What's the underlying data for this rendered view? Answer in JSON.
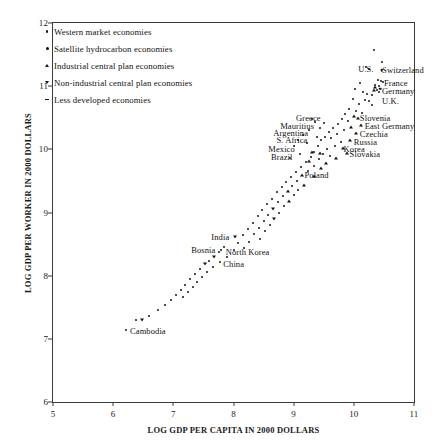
{
  "chart_data": {
    "type": "scatter",
    "title": "",
    "xlabel": "LOG GDP PER CAPITA IN 2000 DOLLARS",
    "ylabel": "LOG GDP PER WORKER IN 2000 DOLLARS",
    "xlim": [
      5,
      11
    ],
    "ylim": [
      6,
      12
    ],
    "xticks": [
      5,
      6,
      7,
      8,
      9,
      10,
      11
    ],
    "yticks": [
      6,
      7,
      8,
      9,
      10,
      11,
      12
    ],
    "grid": false,
    "legend_position": "top-left",
    "legend": [
      {
        "label": "Western market economies",
        "marker": "dot"
      },
      {
        "label": "Satellite hydrocarbon economies",
        "marker": "dot-lg"
      },
      {
        "label": "Industrial central plan economies",
        "marker": "tri"
      },
      {
        "label": "Non-industrial central plan economies",
        "marker": "tri-d"
      },
      {
        "label": "Less developed economies",
        "marker": "dash"
      }
    ],
    "annotations": [
      {
        "text": "U.S.",
        "x": 10.33,
        "y": 11.27,
        "align": "right"
      },
      {
        "text": "Switzerland",
        "x": 10.47,
        "y": 11.25,
        "align": "left"
      },
      {
        "text": "France",
        "x": 10.5,
        "y": 11.05,
        "align": "left"
      },
      {
        "text": "Germany",
        "x": 10.47,
        "y": 10.92,
        "align": "left"
      },
      {
        "text": "U.K.",
        "x": 10.47,
        "y": 10.76,
        "align": "left"
      },
      {
        "text": "Slovenia",
        "x": 10.1,
        "y": 10.5,
        "align": "left"
      },
      {
        "text": "East Germany",
        "x": 10.18,
        "y": 10.37,
        "align": "left"
      },
      {
        "text": "Czechia",
        "x": 10.1,
        "y": 10.24,
        "align": "left"
      },
      {
        "text": "Russia",
        "x": 10.0,
        "y": 10.12,
        "align": "left"
      },
      {
        "text": "Korea",
        "x": 9.83,
        "y": 10.0,
        "align": "left"
      },
      {
        "text": "Slovakia",
        "x": 9.93,
        "y": 9.92,
        "align": "left"
      },
      {
        "text": "Greece",
        "x": 9.45,
        "y": 10.5,
        "align": "right"
      },
      {
        "text": "Mauritius",
        "x": 9.34,
        "y": 10.37,
        "align": "right"
      },
      {
        "text": "Argentina",
        "x": 9.24,
        "y": 10.26,
        "align": "right"
      },
      {
        "text": "S. Africa",
        "x": 9.23,
        "y": 10.15,
        "align": "right"
      },
      {
        "text": "Mexico",
        "x": 9.02,
        "y": 10.0,
        "align": "right"
      },
      {
        "text": "Brazil",
        "x": 8.98,
        "y": 9.88,
        "align": "right"
      },
      {
        "text": "Poland",
        "x": 9.18,
        "y": 9.6,
        "align": "left"
      },
      {
        "text": "India",
        "x": 7.93,
        "y": 8.62,
        "align": "right"
      },
      {
        "text": "Bosnia",
        "x": 7.7,
        "y": 8.4,
        "align": "right"
      },
      {
        "text": "North Korea",
        "x": 7.87,
        "y": 8.37,
        "align": "left"
      },
      {
        "text": "China",
        "x": 7.83,
        "y": 8.18,
        "align": "left"
      },
      {
        "text": "Cambodia",
        "x": 6.28,
        "y": 7.12,
        "align": "left"
      }
    ],
    "points": [
      {
        "x": 10.33,
        "y": 11.58,
        "m": "dot"
      },
      {
        "x": 10.2,
        "y": 11.3,
        "m": "dot"
      },
      {
        "x": 10.46,
        "y": 11.38,
        "m": "dot"
      },
      {
        "x": 10.25,
        "y": 11.27,
        "m": "dot"
      },
      {
        "x": 10.46,
        "y": 11.25,
        "m": "dot-lg"
      },
      {
        "x": 10.4,
        "y": 11.1,
        "m": "dot"
      },
      {
        "x": 10.45,
        "y": 11.08,
        "m": "dot"
      },
      {
        "x": 10.48,
        "y": 11.06,
        "m": "dot"
      },
      {
        "x": 10.36,
        "y": 11.02,
        "m": "dot"
      },
      {
        "x": 10.42,
        "y": 11.0,
        "m": "dot"
      },
      {
        "x": 10.44,
        "y": 10.96,
        "m": "dot-lg"
      },
      {
        "x": 10.38,
        "y": 10.94,
        "m": "dot"
      },
      {
        "x": 10.41,
        "y": 10.9,
        "m": "dot"
      },
      {
        "x": 10.1,
        "y": 11.05,
        "m": "dot"
      },
      {
        "x": 10.02,
        "y": 10.95,
        "m": "dot"
      },
      {
        "x": 10.16,
        "y": 10.9,
        "m": "dot"
      },
      {
        "x": 10.22,
        "y": 10.88,
        "m": "dot"
      },
      {
        "x": 10.3,
        "y": 10.86,
        "m": "dot"
      },
      {
        "x": 10.18,
        "y": 10.78,
        "m": "dot"
      },
      {
        "x": 10.26,
        "y": 10.76,
        "m": "dot"
      },
      {
        "x": 10.08,
        "y": 10.72,
        "m": "dot"
      },
      {
        "x": 9.98,
        "y": 10.8,
        "m": "dot"
      },
      {
        "x": 10.3,
        "y": 10.7,
        "m": "dot"
      },
      {
        "x": 9.92,
        "y": 10.64,
        "m": "dot"
      },
      {
        "x": 10.04,
        "y": 10.6,
        "m": "dot"
      },
      {
        "x": 10.14,
        "y": 10.58,
        "m": "dot"
      },
      {
        "x": 9.86,
        "y": 10.56,
        "m": "dot"
      },
      {
        "x": 10.0,
        "y": 10.52,
        "m": "tri"
      },
      {
        "x": 10.07,
        "y": 10.5,
        "m": "tri"
      },
      {
        "x": 9.8,
        "y": 10.48,
        "m": "dot"
      },
      {
        "x": 9.9,
        "y": 10.45,
        "m": "dot"
      },
      {
        "x": 10.12,
        "y": 10.38,
        "m": "tri"
      },
      {
        "x": 9.74,
        "y": 10.4,
        "m": "dot"
      },
      {
        "x": 9.96,
        "y": 10.36,
        "m": "tri"
      },
      {
        "x": 9.66,
        "y": 10.34,
        "m": "dot"
      },
      {
        "x": 9.84,
        "y": 10.3,
        "m": "dot"
      },
      {
        "x": 10.03,
        "y": 10.26,
        "m": "tri"
      },
      {
        "x": 9.58,
        "y": 10.28,
        "m": "dot"
      },
      {
        "x": 9.72,
        "y": 10.24,
        "m": "dot"
      },
      {
        "x": 9.62,
        "y": 10.18,
        "m": "dot"
      },
      {
        "x": 9.94,
        "y": 10.14,
        "m": "tri"
      },
      {
        "x": 9.52,
        "y": 10.2,
        "m": "dot"
      },
      {
        "x": 9.78,
        "y": 10.12,
        "m": "dot"
      },
      {
        "x": 9.46,
        "y": 10.14,
        "m": "dot"
      },
      {
        "x": 9.68,
        "y": 10.06,
        "m": "dot"
      },
      {
        "x": 9.82,
        "y": 10.02,
        "m": "tri"
      },
      {
        "x": 9.56,
        "y": 10.0,
        "m": "dot"
      },
      {
        "x": 9.88,
        "y": 9.94,
        "m": "tri"
      },
      {
        "x": 9.4,
        "y": 10.06,
        "m": "dot"
      },
      {
        "x": 9.34,
        "y": 9.96,
        "m": "dot"
      },
      {
        "x": 9.48,
        "y": 9.92,
        "m": "dot"
      },
      {
        "x": 9.6,
        "y": 9.9,
        "m": "dot"
      },
      {
        "x": 9.28,
        "y": 9.88,
        "m": "dot"
      },
      {
        "x": 9.7,
        "y": 9.86,
        "m": "tri"
      },
      {
        "x": 9.42,
        "y": 9.84,
        "m": "dot"
      },
      {
        "x": 9.2,
        "y": 9.8,
        "m": "dot"
      },
      {
        "x": 9.54,
        "y": 9.78,
        "m": "tri"
      },
      {
        "x": 9.33,
        "y": 9.74,
        "m": "dot"
      },
      {
        "x": 9.12,
        "y": 9.72,
        "m": "dot"
      },
      {
        "x": 9.46,
        "y": 9.7,
        "m": "tri"
      },
      {
        "x": 9.24,
        "y": 9.66,
        "m": "dot"
      },
      {
        "x": 9.04,
        "y": 9.64,
        "m": "dot"
      },
      {
        "x": 9.14,
        "y": 9.6,
        "m": "tri"
      },
      {
        "x": 9.34,
        "y": 9.58,
        "m": "tri"
      },
      {
        "x": 8.96,
        "y": 9.56,
        "m": "dot"
      },
      {
        "x": 9.06,
        "y": 9.5,
        "m": "dot"
      },
      {
        "x": 8.88,
        "y": 9.48,
        "m": "dot"
      },
      {
        "x": 9.18,
        "y": 9.44,
        "m": "tri"
      },
      {
        "x": 8.98,
        "y": 9.42,
        "m": "dot"
      },
      {
        "x": 8.8,
        "y": 9.4,
        "m": "dot"
      },
      {
        "x": 9.08,
        "y": 9.36,
        "m": "dot"
      },
      {
        "x": 8.9,
        "y": 9.34,
        "m": "tri"
      },
      {
        "x": 8.72,
        "y": 9.32,
        "m": "dot"
      },
      {
        "x": 9.0,
        "y": 9.28,
        "m": "dot"
      },
      {
        "x": 8.82,
        "y": 9.26,
        "m": "dot"
      },
      {
        "x": 8.64,
        "y": 9.22,
        "m": "dot"
      },
      {
        "x": 8.92,
        "y": 9.18,
        "m": "tri"
      },
      {
        "x": 8.74,
        "y": 9.16,
        "m": "dot"
      },
      {
        "x": 8.56,
        "y": 9.14,
        "m": "dot"
      },
      {
        "x": 8.84,
        "y": 9.1,
        "m": "dot"
      },
      {
        "x": 8.66,
        "y": 9.06,
        "m": "tri-d"
      },
      {
        "x": 8.48,
        "y": 9.04,
        "m": "dot"
      },
      {
        "x": 8.76,
        "y": 9.0,
        "m": "dot"
      },
      {
        "x": 8.58,
        "y": 8.96,
        "m": "dot"
      },
      {
        "x": 8.4,
        "y": 8.94,
        "m": "dot"
      },
      {
        "x": 8.68,
        "y": 8.9,
        "m": "tri-d"
      },
      {
        "x": 8.5,
        "y": 8.86,
        "m": "dot"
      },
      {
        "x": 8.32,
        "y": 8.84,
        "m": "dot"
      },
      {
        "x": 8.6,
        "y": 8.8,
        "m": "dot"
      },
      {
        "x": 8.42,
        "y": 8.76,
        "m": "dot"
      },
      {
        "x": 8.24,
        "y": 8.74,
        "m": "dot"
      },
      {
        "x": 8.52,
        "y": 8.7,
        "m": "dot"
      },
      {
        "x": 8.34,
        "y": 8.66,
        "m": "dot"
      },
      {
        "x": 8.16,
        "y": 8.64,
        "m": "dot"
      },
      {
        "x": 8.03,
        "y": 8.62,
        "m": "tri-d"
      },
      {
        "x": 8.44,
        "y": 8.58,
        "m": "dot"
      },
      {
        "x": 8.26,
        "y": 8.54,
        "m": "dot"
      },
      {
        "x": 8.08,
        "y": 8.52,
        "m": "dot"
      },
      {
        "x": 7.84,
        "y": 8.46,
        "m": "dot"
      },
      {
        "x": 7.8,
        "y": 8.4,
        "m": "dot"
      },
      {
        "x": 7.76,
        "y": 8.38,
        "m": "dot"
      },
      {
        "x": 8.18,
        "y": 8.44,
        "m": "dot"
      },
      {
        "x": 8.0,
        "y": 8.4,
        "m": "dot"
      },
      {
        "x": 7.68,
        "y": 8.3,
        "m": "tri-d"
      },
      {
        "x": 7.9,
        "y": 8.3,
        "m": "dot"
      },
      {
        "x": 7.6,
        "y": 8.24,
        "m": "dot"
      },
      {
        "x": 7.78,
        "y": 8.22,
        "m": "dot"
      },
      {
        "x": 7.52,
        "y": 8.18,
        "m": "tri-d"
      },
      {
        "x": 7.66,
        "y": 8.14,
        "m": "dot"
      },
      {
        "x": 7.44,
        "y": 8.1,
        "m": "dot"
      },
      {
        "x": 7.56,
        "y": 8.06,
        "m": "dot"
      },
      {
        "x": 7.36,
        "y": 8.02,
        "m": "dot"
      },
      {
        "x": 7.48,
        "y": 7.98,
        "m": "dot"
      },
      {
        "x": 7.28,
        "y": 7.94,
        "m": "dot"
      },
      {
        "x": 7.4,
        "y": 7.9,
        "m": "dot"
      },
      {
        "x": 7.2,
        "y": 7.86,
        "m": "dot"
      },
      {
        "x": 7.32,
        "y": 7.82,
        "m": "dot"
      },
      {
        "x": 7.12,
        "y": 7.78,
        "m": "dot"
      },
      {
        "x": 7.24,
        "y": 7.74,
        "m": "dot"
      },
      {
        "x": 7.04,
        "y": 7.7,
        "m": "dot"
      },
      {
        "x": 7.16,
        "y": 7.66,
        "m": "dot"
      },
      {
        "x": 6.96,
        "y": 7.62,
        "m": "dot"
      },
      {
        "x": 6.86,
        "y": 7.54,
        "m": "dot"
      },
      {
        "x": 6.74,
        "y": 7.46,
        "m": "dot"
      },
      {
        "x": 6.6,
        "y": 7.36,
        "m": "dot"
      },
      {
        "x": 6.48,
        "y": 7.3,
        "m": "tri-d"
      },
      {
        "x": 6.38,
        "y": 7.3,
        "m": "dot"
      },
      {
        "x": 6.22,
        "y": 7.14,
        "m": "dot"
      },
      {
        "x": 9.3,
        "y": 10.48,
        "m": "dot"
      },
      {
        "x": 9.36,
        "y": 10.44,
        "m": "dot"
      },
      {
        "x": 9.5,
        "y": 10.42,
        "m": "dot"
      },
      {
        "x": 9.44,
        "y": 10.34,
        "m": "dot"
      },
      {
        "x": 9.26,
        "y": 10.3,
        "m": "dot"
      },
      {
        "x": 9.16,
        "y": 10.22,
        "m": "dot"
      },
      {
        "x": 9.38,
        "y": 10.2,
        "m": "dot"
      },
      {
        "x": 9.08,
        "y": 10.14,
        "m": "dot"
      },
      {
        "x": 9.22,
        "y": 10.1,
        "m": "dot"
      },
      {
        "x": 9.0,
        "y": 10.06,
        "m": "dot"
      },
      {
        "x": 9.3,
        "y": 9.96,
        "m": "tri"
      },
      {
        "x": 9.44,
        "y": 9.94,
        "m": "tri"
      },
      {
        "x": 9.1,
        "y": 9.92,
        "m": "dot"
      },
      {
        "x": 8.94,
        "y": 9.86,
        "m": "dot"
      },
      {
        "x": 9.26,
        "y": 9.82,
        "m": "tri"
      },
      {
        "x": 10.36,
        "y": 10.98,
        "m": "tri"
      },
      {
        "x": 10.34,
        "y": 10.94,
        "m": "tri"
      }
    ]
  }
}
